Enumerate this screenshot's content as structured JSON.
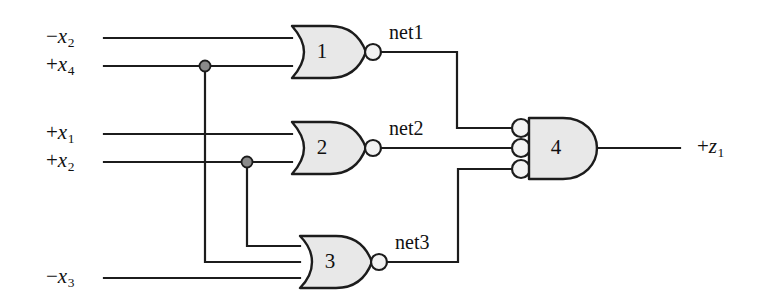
{
  "figure": {
    "kind": "logic-circuit-schematic",
    "width": 766,
    "height": 294,
    "background_color": "#ffffff",
    "line_color": "#1c1c1c",
    "gate_fill_color": "#e8e8e8",
    "junction_color": "#8a8a8a"
  },
  "inputs": [
    {
      "id": "in-x2-neg",
      "sign": "−",
      "var": "x",
      "index": "2",
      "text": "−x2"
    },
    {
      "id": "in-x4-pos",
      "sign": "+",
      "var": "x",
      "index": "4",
      "text": "+x4"
    },
    {
      "id": "in-x1-pos",
      "sign": "+",
      "var": "x",
      "index": "1",
      "text": "+x1"
    },
    {
      "id": "in-x2-pos",
      "sign": "+",
      "var": "x",
      "index": "2",
      "text": "+x2"
    },
    {
      "id": "in-x3-neg",
      "sign": "−",
      "var": "x",
      "index": "3",
      "text": "−x3"
    }
  ],
  "outputs": [
    {
      "id": "out-z1",
      "sign": "+",
      "var": "z",
      "index": "1",
      "text": "+z1"
    }
  ],
  "nets": [
    {
      "id": "net1",
      "label": "net1"
    },
    {
      "id": "net2",
      "label": "net2"
    },
    {
      "id": "net3",
      "label": "net3"
    }
  ],
  "gates": [
    {
      "id": "gate-1",
      "number": "1",
      "type": "NOR",
      "inputs": 2,
      "output_net": "net1"
    },
    {
      "id": "gate-2",
      "number": "2",
      "type": "NOR",
      "inputs": 2,
      "output_net": "net2"
    },
    {
      "id": "gate-3",
      "number": "3",
      "type": "NOR",
      "inputs": 3,
      "output_net": "net3"
    },
    {
      "id": "gate-4",
      "number": "4",
      "type": "AND-with-inverted-inputs",
      "inputs": 3,
      "output_net": "+z1"
    }
  ],
  "junctions": [
    {
      "id": "junction-x4",
      "on_signal": "+x4"
    },
    {
      "id": "junction-x2",
      "on_signal": "+x2"
    }
  ]
}
